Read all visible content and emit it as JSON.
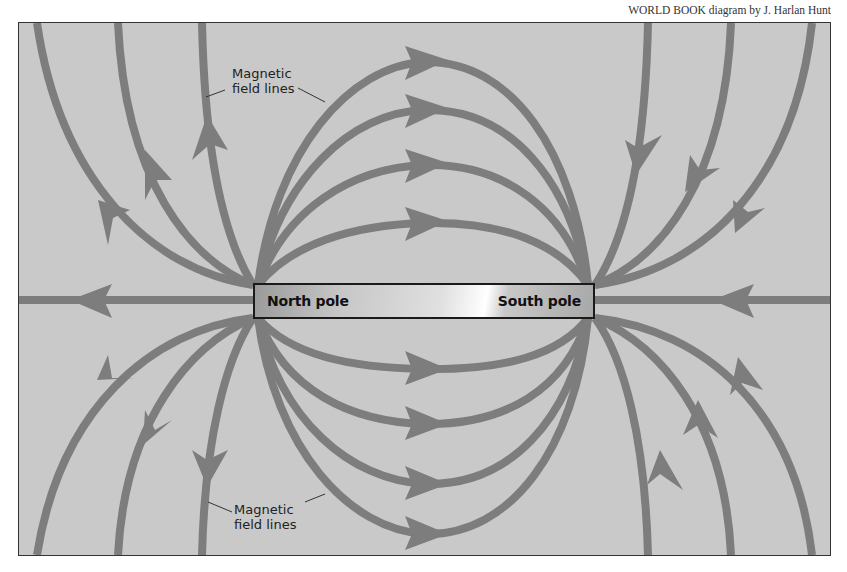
{
  "credit": "WORLD BOOK diagram by J. Harlan Hunt",
  "magnet": {
    "north_label": "North pole",
    "south_label": "South pole"
  },
  "labels": {
    "top": {
      "line1": "Magnetic",
      "line2": "field lines"
    },
    "bottom": {
      "line1": "Magnetic",
      "line2": "field lines"
    }
  },
  "colors": {
    "background": "#c9c9c9",
    "field_line": "#7d7d7d",
    "frame_border": "#333333"
  }
}
